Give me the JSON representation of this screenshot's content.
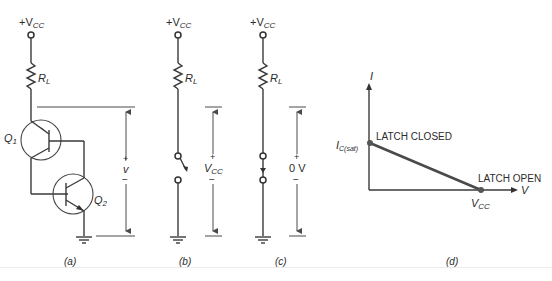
{
  "figure": {
    "panels": [
      {
        "id": "a",
        "caption": "(a)",
        "supply_label": "+V",
        "supply_sub": "CC",
        "resistor_label": "R",
        "resistor_sub": "L",
        "transistor1_label": "Q",
        "transistor1_sub": "1",
        "transistor2_label": "Q",
        "transistor2_sub": "2",
        "voltage_plus": "+",
        "voltage_label": "v",
        "voltage_minus": "−"
      },
      {
        "id": "b",
        "caption": "(b)",
        "supply_label": "+V",
        "supply_sub": "CC",
        "resistor_label": "R",
        "resistor_sub": "L",
        "switch_state": "open",
        "voltage_plus": "+",
        "voltage_label": "V",
        "voltage_sub": "CC",
        "voltage_minus": "−"
      },
      {
        "id": "c",
        "caption": "(c)",
        "supply_label": "+V",
        "supply_sub": "CC",
        "resistor_label": "R",
        "resistor_sub": "L",
        "switch_state": "closed",
        "voltage_plus": "+",
        "voltage_label": "0 V",
        "voltage_minus": "−"
      },
      {
        "id": "d",
        "caption": "(d)",
        "y_axis_label": "I",
        "x_axis_label": "V",
        "y_intercept_label": "I",
        "y_intercept_sub": "C(sat)",
        "x_intercept_label": "V",
        "x_intercept_sub": "CC",
        "point_top_label": "LATCH CLOSED",
        "point_bottom_label": "LATCH OPEN",
        "load_line_color": "#4a4a4a"
      }
    ]
  }
}
